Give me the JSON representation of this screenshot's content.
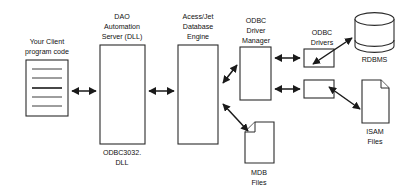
{
  "diagram": {
    "background_color": "#ffffff",
    "line_color": "#1a1a1a",
    "text_color": "#111111",
    "nodes": {
      "client": {
        "label_line1": "Your Client",
        "label_line2": "program code",
        "shape": "document-with-lines",
        "icon": "document-icon"
      },
      "dao": {
        "label_line1": "DAO",
        "label_line2": "Automation",
        "label_line3": "Server (DLL)",
        "caption_line1": "ODBC3032.",
        "caption_line2": "DLL",
        "shape": "rectangle"
      },
      "jet": {
        "label_line1": "Acess/Jet",
        "label_line2": "Database",
        "label_line3": "Engine",
        "shape": "rectangle"
      },
      "odbc_manager": {
        "label_line1": "ODBC",
        "label_line2": "Driver",
        "label_line3": "Manager",
        "shape": "rectangle"
      },
      "odbc_drivers": {
        "label_line1": "ODBC",
        "label_line2": "Drivers",
        "shape": "rectangle-pair"
      },
      "rdbms": {
        "label": "RDBMS",
        "shape": "cylinder",
        "icon": "database-cylinder-icon"
      },
      "isam": {
        "label_line1": "ISAM",
        "label_line2": "Files",
        "shape": "document",
        "icon": "document-icon"
      },
      "mdb": {
        "label_line1": "MDB",
        "label_line2": "Files",
        "shape": "document",
        "icon": "document-icon"
      }
    },
    "connectors": [
      {
        "name": "client-to-dao",
        "from": "client",
        "to": "dao",
        "style": "double-arrow-horizontal"
      },
      {
        "name": "dao-to-jet",
        "from": "dao",
        "to": "jet",
        "style": "double-arrow-horizontal"
      },
      {
        "name": "jet-to-odbc-manager",
        "from": "jet",
        "to": "odbc_manager",
        "style": "double-arrow-diagonal-up"
      },
      {
        "name": "jet-to-mdb",
        "from": "jet",
        "to": "mdb",
        "style": "double-arrow-diagonal-down"
      },
      {
        "name": "odbc-manager-to-driver-top",
        "from": "odbc_manager",
        "to": "odbc_drivers",
        "style": "double-arrow-horizontal"
      },
      {
        "name": "odbc-manager-to-driver-bottom",
        "from": "odbc_manager",
        "to": "odbc_drivers",
        "style": "double-arrow-horizontal"
      },
      {
        "name": "driver-top-to-rdbms",
        "from": "odbc_drivers",
        "to": "rdbms",
        "style": "double-arrow-diagonal-up"
      },
      {
        "name": "driver-bottom-to-isam",
        "from": "odbc_drivers",
        "to": "isam",
        "style": "double-arrow-diagonal-down"
      }
    ]
  }
}
